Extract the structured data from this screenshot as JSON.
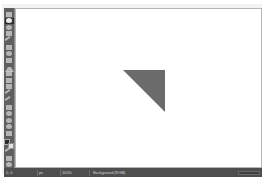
{
  "app": {
    "title": "Untitled - Drawing",
    "window_background": "#ffffff"
  },
  "toolbox": {
    "name": "Toolbox",
    "background_color": "#5f5f5f",
    "active_tool": "free-select",
    "tools": [
      {
        "id": "rect-select",
        "label": "Rectangle Select",
        "icon": "rect-select-icon",
        "shape": "g-sq",
        "active": false
      },
      {
        "id": "free-select",
        "label": "Free Select",
        "icon": "free-select-icon",
        "shape": "g-rd",
        "active": true
      },
      {
        "id": "fuzzy-select",
        "label": "Fuzzy Select",
        "icon": "fuzzy-select-icon",
        "shape": "g-rd",
        "active": false
      },
      {
        "id": "scissors",
        "label": "Scissors Select",
        "icon": "scissors-icon",
        "shape": "g-sq",
        "active": false
      },
      {
        "id": "move",
        "label": "Move",
        "icon": "move-icon",
        "shape": "g-diag",
        "active": false
      },
      {
        "id": "crop",
        "label": "Crop",
        "icon": "crop-icon",
        "shape": "g-sq",
        "active": false
      },
      {
        "id": "rotate",
        "label": "Rotate",
        "icon": "rotate-icon",
        "shape": "g-rd",
        "active": false
      },
      {
        "id": "scale",
        "label": "Scale",
        "icon": "scale-icon",
        "shape": "g-sq",
        "active": false
      },
      {
        "id": "flip",
        "label": "Flip",
        "icon": "flip-icon",
        "shape": "g-tri",
        "active": false
      },
      {
        "id": "text",
        "label": "Text",
        "icon": "text-icon",
        "shape": "g-tall",
        "active": false
      },
      {
        "id": "bucket-fill",
        "label": "Bucket Fill",
        "icon": "bucket-fill-icon",
        "shape": "g-sq",
        "active": false
      },
      {
        "id": "gradient",
        "label": "Gradient",
        "icon": "gradient-icon",
        "shape": "g-thin",
        "active": false
      },
      {
        "id": "pencil",
        "label": "Pencil",
        "icon": "pencil-icon",
        "shape": "g-diag",
        "active": false
      },
      {
        "id": "paintbrush",
        "label": "Paintbrush",
        "icon": "paintbrush-icon",
        "shape": "g-diag",
        "active": false
      },
      {
        "id": "eraser",
        "label": "Eraser",
        "icon": "eraser-icon",
        "shape": "g-sq",
        "active": false
      },
      {
        "id": "airbrush",
        "label": "Airbrush",
        "icon": "airbrush-icon",
        "shape": "g-rd",
        "active": false
      },
      {
        "id": "clone",
        "label": "Clone",
        "icon": "clone-icon",
        "shape": "g-rd",
        "active": false
      },
      {
        "id": "blur-sharpen",
        "label": "Blur / Sharpen",
        "icon": "blur-icon",
        "shape": "g-rd",
        "active": false
      },
      {
        "id": "smudge",
        "label": "Smudge",
        "icon": "smudge-icon",
        "shape": "g-thin",
        "active": false
      },
      {
        "id": "color-picker",
        "label": "Color Picker",
        "icon": "eyedropper-icon",
        "shape": "g-diag",
        "active": false
      },
      {
        "id": "measure",
        "label": "Measure",
        "icon": "measure-icon",
        "shape": "g-thin",
        "active": false
      },
      {
        "id": "zoom",
        "label": "Zoom",
        "icon": "magnifier-icon",
        "shape": "g-rd",
        "active": false
      }
    ],
    "colors": {
      "foreground_label": "Foreground color",
      "foreground": "#2b2b2b",
      "background_label": "Background color",
      "background": "#e2e2e2"
    }
  },
  "canvas": {
    "name": "Drawing canvas",
    "background": "#ffffff",
    "border_color": "#b6b6b6",
    "shapes": [
      {
        "id": "triangle-1",
        "type": "right-triangle",
        "label": "Filled right triangle",
        "fill": "#6b6b6b",
        "x": 107,
        "y": 61,
        "width": 42,
        "height": 42,
        "right_angle_corner": "bottom-left"
      }
    ]
  },
  "status_bar": {
    "name": "Status bar",
    "background_color": "#4e4e4e",
    "position": "0, 0",
    "units": "px",
    "zoom": "100%",
    "layer": "Background (RGB)",
    "message": "",
    "memory": "",
    "progress_percent": 0
  }
}
